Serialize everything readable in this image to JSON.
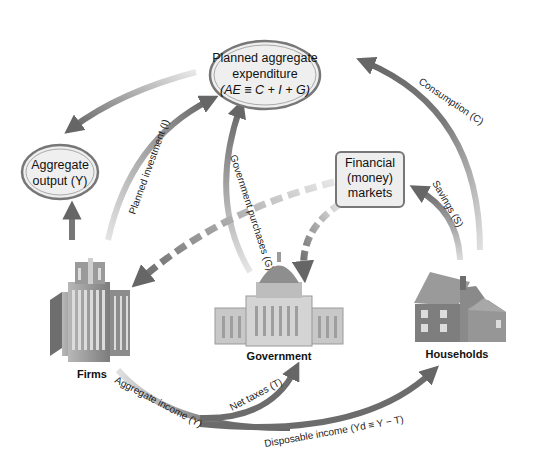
{
  "diagram": {
    "type": "circular-flow",
    "nodes": {
      "planned_ae": {
        "line1": "Planned aggregate",
        "line2": "expenditure",
        "line3": "(AE ≡ C + I + G)"
      },
      "aggregate_output": {
        "line1": "Aggregate",
        "line2": "output (Y)"
      },
      "financial_markets": {
        "line1": "Financial",
        "line2": "(money)",
        "line3": "markets"
      }
    },
    "sectors": {
      "firms": "Firms",
      "government": "Government",
      "households": "Households"
    },
    "flows": {
      "consumption": "Consumption (C)",
      "savings": "Savings (S)",
      "planned_investment": "Planned investment (I)",
      "government_purchases": "Government purchases (G)",
      "aggregate_income": "Aggregate income (Y)",
      "net_taxes": "Net taxes (T)",
      "disposable_income": "Disposable income (Yd ≡ Y − T)"
    },
    "colors": {
      "arrow": "#6e6e6e",
      "arrow_light": "#d0d0d0",
      "node_fill": "#eeeeee",
      "node_stroke": "#777777",
      "building": "#8a8a8a"
    }
  }
}
